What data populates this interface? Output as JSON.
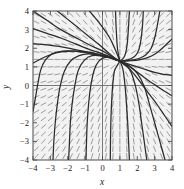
{
  "figure": {
    "kind": "direction-field-with-solution-curves",
    "background_color": "#ffffff",
    "plot_background_color": "#f2f2f2",
    "frame_color": "#4a4a4a",
    "axis_color": "#5a5a5a",
    "field_color": "#8d8d8d",
    "curve_color": "#2b2b2b"
  },
  "axes": {
    "x": {
      "label": "x",
      "min": -4,
      "max": 4,
      "ticks": [
        -4,
        -3,
        -2,
        -1,
        0,
        1,
        2,
        3,
        4
      ],
      "tick_labels": [
        "-4",
        "-3",
        "-2",
        "-1",
        "0",
        "1",
        "2",
        "3",
        "4"
      ]
    },
    "y": {
      "label": "y",
      "min": -4,
      "max": 4,
      "ticks": [
        -4,
        -3,
        -2,
        -1,
        0,
        1,
        2,
        3,
        4
      ],
      "tick_labels": [
        "-4",
        "-3",
        "-2",
        "-1",
        "0",
        "1",
        "2",
        "3",
        "4"
      ]
    }
  },
  "chart_data": {
    "type": "line",
    "title": "",
    "xlabel": "x",
    "ylabel": "y",
    "xlim": [
      -4,
      4
    ],
    "ylim": [
      -4,
      4
    ],
    "grid": false,
    "legend": "none",
    "critical_point": {
      "x": 1.0,
      "y": 1.3
    },
    "direction_field": {
      "description": "short slope segments on a grid across the plane",
      "grid_x": [
        -3.8,
        -3.4,
        -3.0,
        -2.6,
        -2.2,
        -1.8,
        -1.4,
        -1.0,
        -0.6,
        -0.2,
        0.2,
        0.6,
        1.0,
        1.4,
        1.8,
        2.2,
        2.6,
        3.0,
        3.4,
        3.8
      ],
      "grid_y": [
        -3.8,
        -3.4,
        -3.0,
        -2.6,
        -2.2,
        -1.8,
        -1.4,
        -1.0,
        -0.6,
        -0.2,
        0.2,
        0.6,
        1.0,
        1.4,
        1.8,
        2.2,
        2.6,
        3.0,
        3.4,
        3.8
      ],
      "segment_length": 0.3,
      "slope_rule": "dy/dx = (y - 1.3) / (x - 1.0)"
    },
    "solution_curves": [
      {
        "name": "ray-upleft-steep",
        "points": [
          [
            -4,
            4
          ],
          [
            -3.2,
            3.5
          ],
          [
            -2.4,
            3.0
          ],
          [
            -1.6,
            2.6
          ],
          [
            -0.8,
            2.2
          ],
          [
            0,
            1.85
          ],
          [
            0.55,
            1.55
          ],
          [
            1,
            1.3
          ]
        ]
      },
      {
        "name": "ray-upleft-mid",
        "points": [
          [
            -4,
            3.05
          ],
          [
            -3.2,
            2.8
          ],
          [
            -2.4,
            2.55
          ],
          [
            -1.6,
            2.25
          ],
          [
            -0.8,
            1.95
          ],
          [
            0,
            1.7
          ],
          [
            0.55,
            1.5
          ],
          [
            1,
            1.3
          ]
        ]
      },
      {
        "name": "ray-left-flat",
        "points": [
          [
            -4,
            2.25
          ],
          [
            -3.3,
            2.2
          ],
          [
            -2.5,
            2.1
          ],
          [
            -1.7,
            1.95
          ],
          [
            -0.9,
            1.8
          ],
          [
            0,
            1.62
          ],
          [
            0.6,
            1.45
          ],
          [
            1,
            1.3
          ]
        ]
      },
      {
        "name": "curve-left-bend-1",
        "points": [
          [
            -4,
            1.2
          ],
          [
            -3.5,
            1.45
          ],
          [
            -3.0,
            1.65
          ],
          [
            -2.4,
            1.8
          ],
          [
            -1.7,
            1.85
          ],
          [
            -1.0,
            1.8
          ],
          [
            -0.4,
            1.7
          ],
          [
            0.2,
            1.58
          ],
          [
            0.7,
            1.42
          ],
          [
            1,
            1.3
          ]
        ]
      },
      {
        "name": "curve-left-drop-1",
        "points": [
          [
            -4,
            -1.4
          ],
          [
            -3.85,
            -0.6
          ],
          [
            -3.7,
            0.2
          ],
          [
            -3.55,
            0.85
          ],
          [
            -3.3,
            1.35
          ],
          [
            -2.9,
            1.7
          ],
          [
            -2.3,
            1.85
          ],
          [
            -1.6,
            1.85
          ],
          [
            -0.9,
            1.75
          ],
          [
            -0.2,
            1.62
          ],
          [
            0.4,
            1.5
          ],
          [
            1,
            1.3
          ]
        ]
      },
      {
        "name": "curve-left-drop-2",
        "points": [
          [
            -2.85,
            -4
          ],
          [
            -2.8,
            -3.0
          ],
          [
            -2.72,
            -2.0
          ],
          [
            -2.6,
            -1.0
          ],
          [
            -2.45,
            -0.1
          ],
          [
            -2.2,
            0.75
          ],
          [
            -1.85,
            1.3
          ],
          [
            -1.35,
            1.6
          ],
          [
            -0.8,
            1.7
          ],
          [
            -0.1,
            1.6
          ],
          [
            0.5,
            1.48
          ],
          [
            1,
            1.3
          ]
        ]
      },
      {
        "name": "curve-left-drop-3",
        "points": [
          [
            -1.95,
            -4
          ],
          [
            -1.9,
            -3.0
          ],
          [
            -1.85,
            -2.0
          ],
          [
            -1.75,
            -1.0
          ],
          [
            -1.6,
            -0.05
          ],
          [
            -1.4,
            0.8
          ],
          [
            -1.05,
            1.35
          ],
          [
            -0.6,
            1.6
          ],
          [
            0,
            1.58
          ],
          [
            0.55,
            1.45
          ],
          [
            1,
            1.3
          ]
        ]
      },
      {
        "name": "curve-left-drop-4",
        "points": [
          [
            -0.95,
            -4
          ],
          [
            -0.92,
            -3.0
          ],
          [
            -0.88,
            -2.0
          ],
          [
            -0.8,
            -1.0
          ],
          [
            -0.68,
            -0.05
          ],
          [
            -0.48,
            0.82
          ],
          [
            -0.2,
            1.32
          ],
          [
            0.2,
            1.52
          ],
          [
            0.65,
            1.45
          ],
          [
            1,
            1.3
          ]
        ]
      },
      {
        "name": "curve-center-drop",
        "points": [
          [
            0.45,
            -4
          ],
          [
            0.46,
            -3.0
          ],
          [
            0.48,
            -2.0
          ],
          [
            0.52,
            -1.0
          ],
          [
            0.58,
            -0.05
          ],
          [
            0.68,
            0.75
          ],
          [
            0.8,
            1.0
          ],
          [
            1,
            1.3
          ]
        ]
      },
      {
        "name": "curve-right-drop-1",
        "points": [
          [
            1.55,
            -4
          ],
          [
            1.5,
            -3.0
          ],
          [
            1.45,
            -2.0
          ],
          [
            1.38,
            -1.0
          ],
          [
            1.3,
            -0.05
          ],
          [
            1.2,
            0.75
          ],
          [
            1.1,
            1.1
          ],
          [
            1,
            1.3
          ]
        ]
      },
      {
        "name": "curve-right-drop-2",
        "points": [
          [
            2.55,
            -4
          ],
          [
            2.4,
            -3.0
          ],
          [
            2.25,
            -2.0
          ],
          [
            2.1,
            -1.0
          ],
          [
            1.9,
            -0.05
          ],
          [
            1.65,
            0.7
          ],
          [
            1.35,
            1.1
          ],
          [
            1,
            1.3
          ]
        ]
      },
      {
        "name": "curve-right-drop-3",
        "points": [
          [
            3.6,
            -4
          ],
          [
            3.3,
            -3.0
          ],
          [
            3.0,
            -2.0
          ],
          [
            2.7,
            -1.0
          ],
          [
            2.4,
            -0.05
          ],
          [
            2.0,
            0.65
          ],
          [
            1.5,
            1.08
          ],
          [
            1,
            1.3
          ]
        ]
      },
      {
        "name": "curve-right-flat-1",
        "points": [
          [
            4,
            -2.2
          ],
          [
            3.6,
            -1.65
          ],
          [
            3.2,
            -1.1
          ],
          [
            2.8,
            -0.6
          ],
          [
            2.4,
            -0.1
          ],
          [
            2.0,
            0.4
          ],
          [
            1.6,
            0.85
          ],
          [
            1.25,
            1.12
          ],
          [
            1,
            1.3
          ]
        ]
      },
      {
        "name": "curve-right-flat-2",
        "points": [
          [
            4,
            -0.55
          ],
          [
            3.55,
            -0.3
          ],
          [
            3.1,
            -0.02
          ],
          [
            2.6,
            0.3
          ],
          [
            2.1,
            0.65
          ],
          [
            1.6,
            0.98
          ],
          [
            1.25,
            1.17
          ],
          [
            1,
            1.3
          ]
        ]
      },
      {
        "name": "curve-right-flat-3",
        "points": [
          [
            4,
            0.55
          ],
          [
            3.5,
            0.6
          ],
          [
            3.0,
            0.7
          ],
          [
            2.5,
            0.85
          ],
          [
            2.0,
            1.0
          ],
          [
            1.5,
            1.15
          ],
          [
            1.2,
            1.24
          ],
          [
            1,
            1.3
          ]
        ]
      },
      {
        "name": "curve-right-up-1",
        "points": [
          [
            4,
            2.5
          ],
          [
            3.5,
            2.05
          ],
          [
            3.05,
            1.7
          ],
          [
            2.6,
            1.5
          ],
          [
            2.1,
            1.38
          ],
          [
            1.6,
            1.33
          ],
          [
            1.2,
            1.31
          ],
          [
            1,
            1.3
          ]
        ]
      },
      {
        "name": "curve-right-up-2",
        "points": [
          [
            3.3,
            4
          ],
          [
            3.15,
            3.2
          ],
          [
            3.0,
            2.55
          ],
          [
            2.8,
            2.0
          ],
          [
            2.5,
            1.65
          ],
          [
            2.1,
            1.45
          ],
          [
            1.6,
            1.35
          ],
          [
            1,
            1.3
          ]
        ]
      },
      {
        "name": "curve-right-up-3",
        "points": [
          [
            2.35,
            4
          ],
          [
            2.3,
            3.2
          ],
          [
            2.22,
            2.5
          ],
          [
            2.1,
            1.95
          ],
          [
            1.9,
            1.6
          ],
          [
            1.6,
            1.42
          ],
          [
            1.25,
            1.33
          ],
          [
            1,
            1.3
          ]
        ]
      },
      {
        "name": "curve-right-up-4",
        "points": [
          [
            1.55,
            4
          ],
          [
            1.5,
            3.2
          ],
          [
            1.45,
            2.5
          ],
          [
            1.38,
            1.95
          ],
          [
            1.28,
            1.6
          ],
          [
            1.15,
            1.42
          ],
          [
            1,
            1.3
          ]
        ]
      },
      {
        "name": "curve-top-up",
        "points": [
          [
            0.75,
            4
          ],
          [
            0.78,
            3.2
          ],
          [
            0.82,
            2.5
          ],
          [
            0.86,
            2.0
          ],
          [
            0.92,
            1.65
          ],
          [
            0.97,
            1.45
          ],
          [
            1,
            1.3
          ]
        ]
      },
      {
        "name": "ray-upleft-top",
        "points": [
          [
            -2.6,
            4
          ],
          [
            -2.0,
            3.55
          ],
          [
            -1.4,
            3.1
          ],
          [
            -0.8,
            2.65
          ],
          [
            -0.2,
            2.2
          ],
          [
            0.35,
            1.75
          ],
          [
            0.75,
            1.45
          ],
          [
            1,
            1.3
          ]
        ]
      },
      {
        "name": "ray-upleft-top2",
        "points": [
          [
            -0.75,
            4
          ],
          [
            -0.3,
            3.5
          ],
          [
            0.1,
            3.0
          ],
          [
            0.45,
            2.5
          ],
          [
            0.7,
            2.0
          ],
          [
            0.88,
            1.6
          ],
          [
            1,
            1.3
          ]
        ]
      }
    ]
  }
}
